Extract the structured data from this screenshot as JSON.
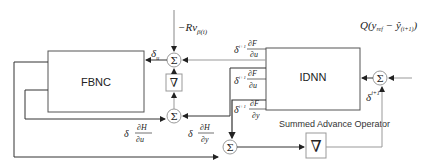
{
  "diagram": {
    "blocks": {
      "fbnc": "FBNC",
      "idnn": "IDNN",
      "grad_top": "∇",
      "grad_bottom": "∇"
    },
    "sum_symbol": "Σ",
    "caption": "Summed Advance Operator",
    "labels": {
      "top_input": "−Rv",
      "top_input_sub": "β(i)",
      "delta_u": "δ",
      "delta_u_sub": "u",
      "delta_u_sup": "i",
      "right_input": "Q(y",
      "right_input_sub": "ref",
      "right_input_mid": " − ŷ",
      "right_input_sub2": "(i+1)",
      "right_input_end": ")",
      "idnn_out1_delta": "δ",
      "idnn_out1_sup": "i+1",
      "idnn_out1_sub": "y",
      "idnn_out1_num": "∂F",
      "idnn_out1_num_sub": "i+1",
      "idnn_out1_den": "∂u",
      "idnn_out1_den_sub": "i",
      "idnn_out2_delta": "δ",
      "idnn_out2_sup": "i+1",
      "idnn_out2_sub": "y",
      "idnn_out2_num": "∂F",
      "idnn_out2_num_sub": "i+1",
      "idnn_out2_den": "∂u",
      "idnn_out2_den_sub": "i−1",
      "idnn_out3_delta": "δ",
      "idnn_out3_sup": "i+1",
      "idnn_out3_sub": "y",
      "idnn_out3_num": "∂F",
      "idnn_out3_num_sub": "i+1",
      "idnn_out3_den": "∂y",
      "idnn_out3_den_sub": "i",
      "delta_y_next": "δ",
      "delta_y_next_sup": "i+1",
      "delta_y_next_sub": "y",
      "fbnc_out1_delta": "δ",
      "fbnc_out1_sub": "u",
      "fbnc_out1_num": "∂H",
      "fbnc_out1_num_sub": "i",
      "fbnc_out1_den": "∂u",
      "fbnc_out1_den_sub": "i−1",
      "fbnc_out2_delta": "δ",
      "fbnc_out2_sub": "u",
      "fbnc_out2_num": "∂H",
      "fbnc_out2_num_sub": "i",
      "fbnc_out2_den": "∂y",
      "fbnc_out2_den_sub": "i"
    },
    "colors": {
      "line": "#333333",
      "light_line": "#999999",
      "box_border": "#555555"
    }
  }
}
